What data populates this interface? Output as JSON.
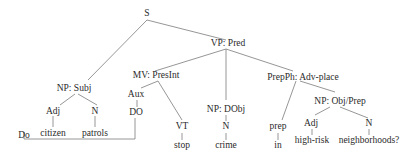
{
  "diagram": {
    "type": "syntax-tree",
    "sentence": "Do citizen patrols stop crime in high-risk neighborhoods?",
    "nodes": {
      "s": "S",
      "vp": "VP: Pred",
      "np_subj": "NP: Subj",
      "mv": "MV: PresInt",
      "np_dobj": "NP: DObj",
      "prepph": "PrepPh: Adv-place",
      "adj1": "Adj",
      "n1": "N",
      "aux": "Aux",
      "do_upper": "DO",
      "vt": "VT",
      "n2": "N",
      "prep": "prep",
      "np_objprep": "NP: Obj/Prep",
      "adj2": "Adj",
      "n3": "N"
    },
    "words": {
      "do": "Do",
      "citizen": "citizen",
      "patrols": "patrols",
      "stop": "stop",
      "crime": "crime",
      "in": "in",
      "highrisk": "high-risk",
      "neighborhoods": "neighborhoods?"
    },
    "line_color": "#8a8a8a",
    "text_color": "#2a2a2a"
  }
}
